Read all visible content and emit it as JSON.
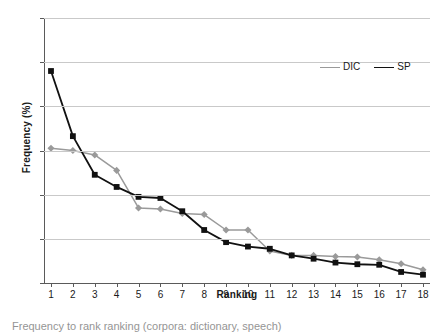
{
  "chart_data": {
    "type": "line",
    "title": "",
    "xlabel": "Ranking",
    "ylabel": "Frequency (%)",
    "x": [
      1,
      2,
      3,
      4,
      5,
      6,
      7,
      8,
      9,
      10,
      11,
      12,
      13,
      14,
      15,
      16,
      17,
      18
    ],
    "xtick_labels": [
      "1",
      "2",
      "3",
      "4",
      "5",
      "6",
      "7",
      "8",
      "9",
      "10",
      "11",
      "12",
      "13",
      "14",
      "15",
      "16",
      "17",
      "18"
    ],
    "ytick_labels": [
      "0",
      "4",
      "8",
      "12",
      "16",
      "20",
      "24"
    ],
    "yticks": [
      0,
      4,
      8,
      12,
      16,
      20,
      24
    ],
    "xlim": [
      1,
      18
    ],
    "ylim": [
      0,
      24
    ],
    "grid": "horizontal",
    "legend_position": "top-right",
    "series": [
      {
        "name": "DIC",
        "color": "#9a9a9a",
        "marker": "diamond",
        "values": [
          12.2,
          12.0,
          11.6,
          10.2,
          6.8,
          6.7,
          6.3,
          6.2,
          4.8,
          4.8,
          2.9,
          2.5,
          2.5,
          2.4,
          2.35,
          2.1,
          1.75,
          1.2
        ]
      },
      {
        "name": "SP",
        "color": "#111111",
        "marker": "square",
        "values": [
          19.2,
          13.3,
          9.8,
          8.7,
          7.8,
          7.7,
          6.5,
          4.8,
          3.7,
          3.3,
          3.1,
          2.5,
          2.2,
          1.85,
          1.7,
          1.65,
          1.0,
          0.75
        ]
      }
    ]
  },
  "legend": {
    "entries": [
      {
        "label": "DIC"
      },
      {
        "label": "SP"
      }
    ]
  },
  "caption": {
    "text": "Frequency to rank ranking (corpora: dictionary, speech)"
  }
}
